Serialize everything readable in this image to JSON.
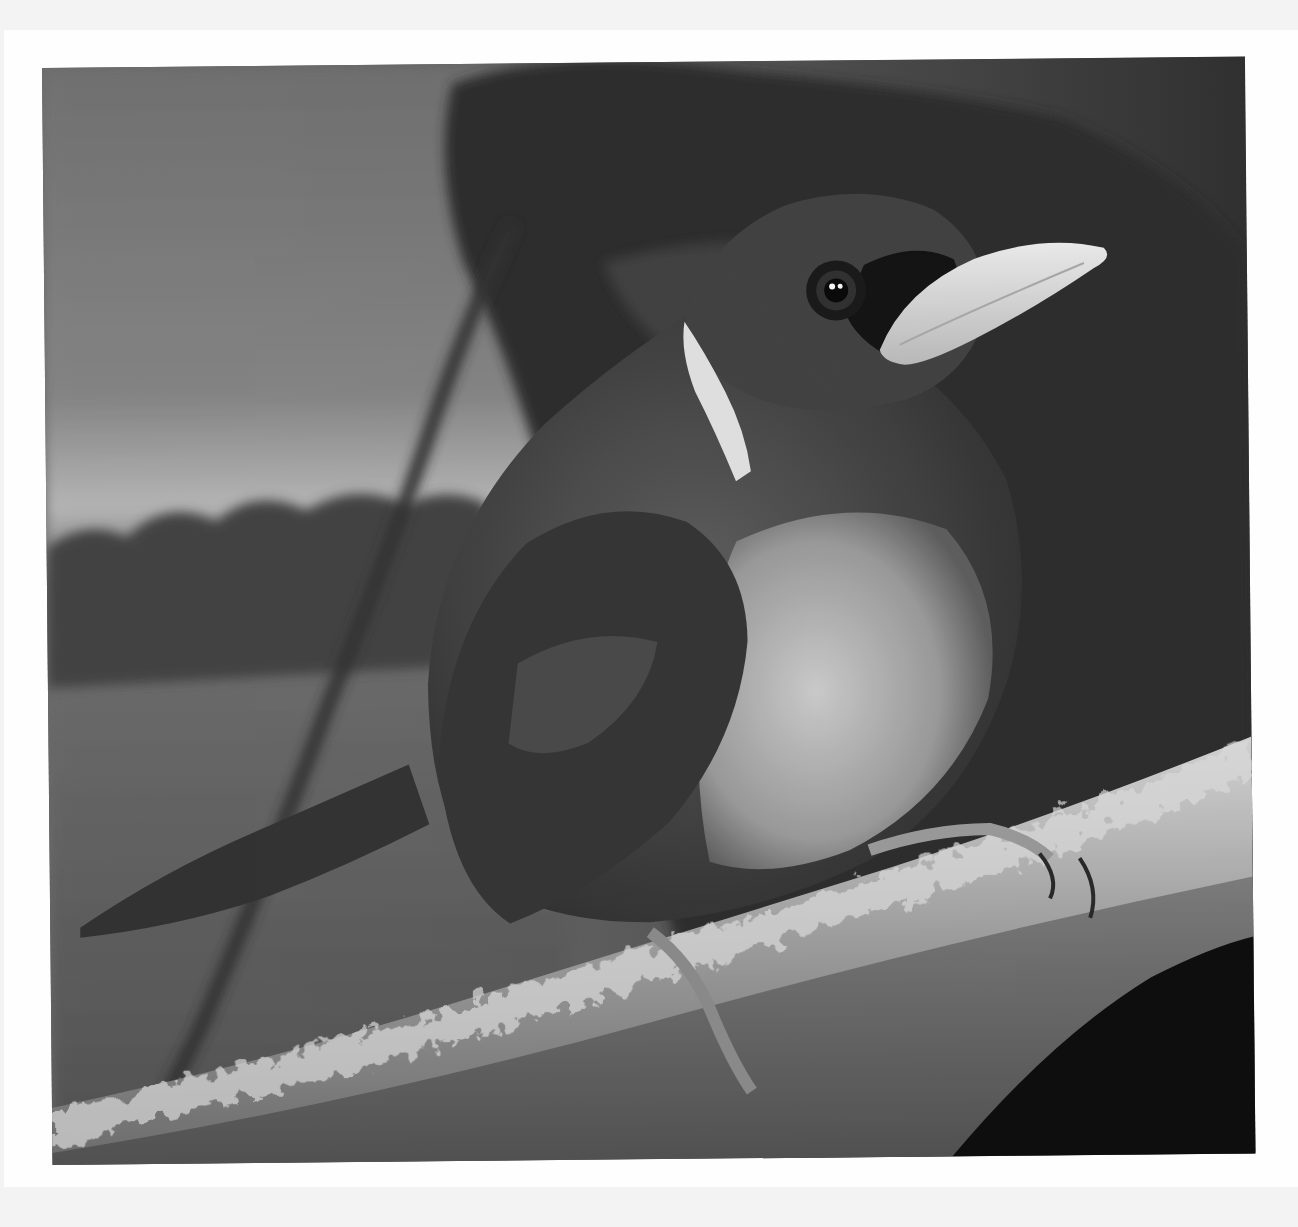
{
  "page": {
    "background": "#fefefe",
    "border_tint": "#f3f3f3"
  },
  "photo": {
    "subject": "bird perched on mossy branch",
    "mode": "black-and-white",
    "elements": [
      "bird",
      "beak",
      "eye",
      "white-collar-stripe",
      "mossy-branch",
      "feet",
      "dark-foliage-background",
      "diagonal-twig"
    ]
  }
}
